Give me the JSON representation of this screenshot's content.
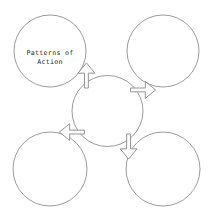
{
  "diagram": {
    "title": "Patterns of Action",
    "type": "hub-and-spoke concept map",
    "background_color": "#ffffff",
    "stroke_color": "#8e8e8e",
    "text_color": "#222222",
    "hub": {
      "name": "center-hub",
      "label": "",
      "cx": 107.5,
      "cy": 111,
      "r": 35.5
    },
    "nodes": [
      {
        "id": "top-left",
        "label_line1": "Patterns of",
        "label_line2": "Action",
        "cx": 50,
        "cy": 51,
        "r": 36
      },
      {
        "id": "top-right",
        "label_line1": "",
        "label_line2": "",
        "cx": 163,
        "cy": 51,
        "r": 36
      },
      {
        "id": "bottom-left",
        "label_line1": "",
        "label_line2": "",
        "cx": 50,
        "cy": 169,
        "r": 37
      },
      {
        "id": "bottom-right",
        "label_line1": "",
        "label_line2": "",
        "cx": 163,
        "cy": 169,
        "r": 37
      }
    ],
    "arrows": [
      {
        "id": "arrow-up-left",
        "direction": "up-left",
        "angle": 225
      },
      {
        "id": "arrow-up-right",
        "direction": "up-right",
        "angle": 315
      },
      {
        "id": "arrow-down-left",
        "direction": "down-left",
        "angle": 135
      },
      {
        "id": "arrow-down-right",
        "direction": "down-right",
        "angle": 45
      }
    ]
  }
}
